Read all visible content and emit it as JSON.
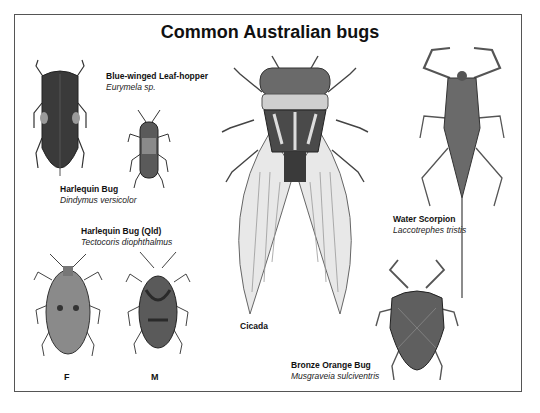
{
  "poster": {
    "title": "Common Australian bugs",
    "colors": {
      "ink": "#111111",
      "body_dark": "#3a3a3a",
      "body_mid": "#7a7a7a",
      "wing": "#e6e6e6",
      "frame": "#555555"
    }
  },
  "specimens": [
    {
      "id": "leafhopper",
      "common_name": "Blue-winged Leaf-hopper",
      "scientific_name": "Eurymela sp."
    },
    {
      "id": "harlequin",
      "common_name": "Harlequin Bug",
      "scientific_name": "Dindymus versicolor"
    },
    {
      "id": "harlequin-qld",
      "common_name": "Harlequin Bug (Qld)",
      "scientific_name": "Tectocoris diophthalmus",
      "sexes": [
        "F",
        "M"
      ]
    },
    {
      "id": "cicada",
      "common_name": "Cicada"
    },
    {
      "id": "water-scorpion",
      "common_name": "Water Scorpion",
      "scientific_name": "Laccotrephes tristis"
    },
    {
      "id": "bronze-orange",
      "common_name": "Bronze Orange Bug",
      "scientific_name": "Musgraveia sulciventris"
    }
  ]
}
